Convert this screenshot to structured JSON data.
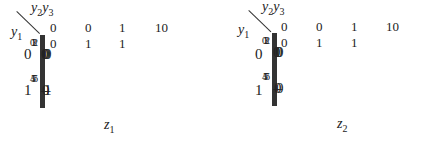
{
  "maps": [
    {
      "name": "z1",
      "title_var": "z",
      "title_sub": "1",
      "col_var": "y",
      "col_var_subs": [
        "2",
        "3"
      ],
      "row_var": "y",
      "row_var_sub": "1",
      "col_headers": [
        "0 0",
        "0 1",
        "1 1",
        "10"
      ],
      "row_headers": [
        "0",
        "1"
      ],
      "cells": [
        [
          {
            "value": "0",
            "index": "0"
          },
          {
            "value": "0",
            "index": "1"
          },
          {
            "value": "0",
            "index": "3"
          },
          {
            "value": "0",
            "index": "2"
          }
        ],
        [
          {
            "value": "–",
            "index": "4"
          },
          {
            "value": "0",
            "index": "5"
          },
          {
            "value": "–",
            "index": "7"
          },
          {
            "value": "1",
            "index": "6"
          }
        ]
      ]
    },
    {
      "name": "z2",
      "title_var": "z",
      "title_sub": "2",
      "col_var": "y",
      "col_var_subs": [
        "2",
        "3"
      ],
      "row_var": "y",
      "row_var_sub": "1",
      "col_headers": [
        "0 0",
        "0 1",
        "1 1",
        "10"
      ],
      "row_headers": [
        "0",
        "1"
      ],
      "cells": [
        [
          {
            "value": "0",
            "index": "0"
          },
          {
            "value": "1",
            "index": "1"
          },
          {
            "value": "0",
            "index": "3"
          },
          {
            "value": "0",
            "index": "2"
          }
        ],
        [
          {
            "value": "–",
            "index": "4"
          },
          {
            "value": "0",
            "index": "5"
          },
          {
            "value": "–",
            "index": "7"
          },
          {
            "value": "0",
            "index": "6"
          }
        ]
      ]
    }
  ]
}
